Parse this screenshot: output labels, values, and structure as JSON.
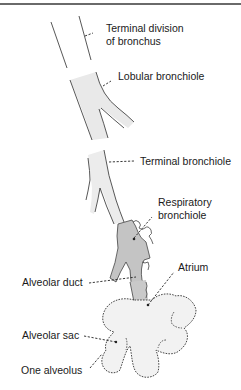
{
  "diagram": {
    "labels": {
      "terminal_division_line1": "Terminal division",
      "terminal_division_line2": "of bronchus",
      "lobular_bronchiole": "Lobular bronchiole",
      "terminal_bronchiole": "Terminal bronchiole",
      "respiratory_bronchiole_line1": "Respiratory",
      "respiratory_bronchiole_line2": "bronchiole",
      "alveolar_duct": "Alveolar duct",
      "atrium": "Atrium",
      "alveolar_sac": "Alveolar sac",
      "one_alveolus": "One alveolus"
    },
    "colors": {
      "outline": "#2a2a2a",
      "bronchiole_fill": "#e9e9e9",
      "respiratory_fill": "#c4c4c4",
      "sac_fill": "#f2f2f2",
      "rule": "#6a6a6a"
    }
  }
}
